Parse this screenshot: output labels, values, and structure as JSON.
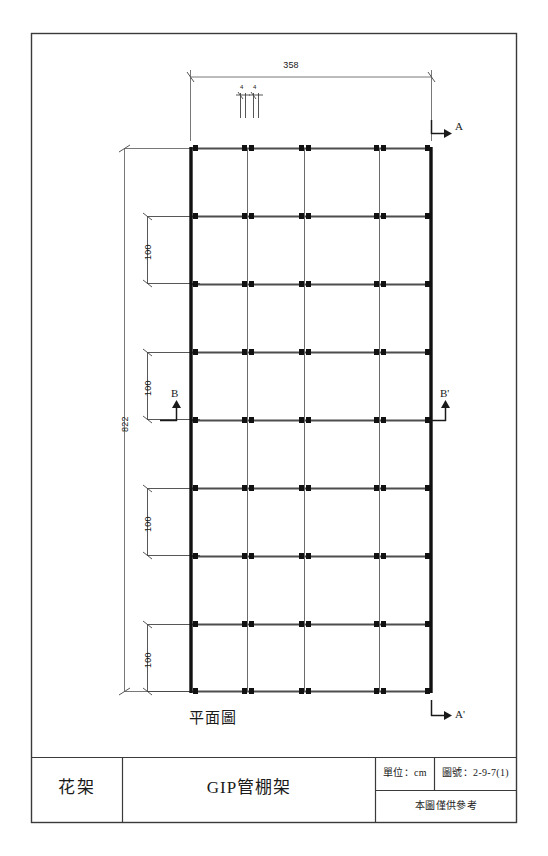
{
  "sheet": {
    "plan_label": "平面圖"
  },
  "dimensions": {
    "top_overall": "358",
    "top_small_left": "4",
    "top_small_right": "4",
    "left_overall": "822",
    "left_bay_1": "100",
    "left_bay_2": "100",
    "left_bay_3": "100",
    "left_bay_4": "100"
  },
  "section_marks": {
    "a": "A",
    "a_prime": "A'",
    "b": "B",
    "b_prime": "B'"
  },
  "title_block": {
    "category": "花架",
    "title": "GIP管棚架",
    "unit_label": "單位：cm",
    "drawing_no": "圖號：2-9-7(1)",
    "note": "本圖僅供參考"
  },
  "colors": {
    "ink": "#1a1a1a",
    "rail": "#4d4d4d",
    "thin": "#555555",
    "paper": "#ffffff"
  },
  "geometry": {
    "frame": {
      "x": 31,
      "y": 33,
      "w": 486,
      "h": 790
    },
    "plan": {
      "left": 190,
      "right": 432,
      "top": 148,
      "bottom": 692
    },
    "verticals": [
      190,
      247,
      249,
      303,
      305,
      378,
      380,
      432
    ],
    "rails_y": [
      148,
      216,
      284,
      352,
      420,
      488,
      556,
      624,
      692
    ]
  }
}
